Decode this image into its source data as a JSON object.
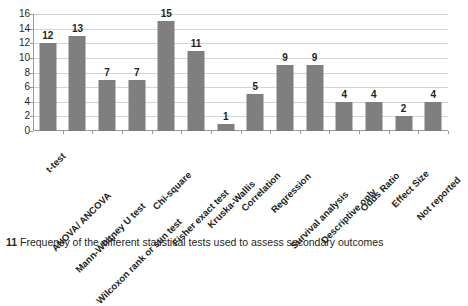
{
  "figure": {
    "caption_number": "11",
    "caption_text": "Frequency of the different statistical tests used to assess secondary outcomes"
  },
  "colors": {
    "bar": "#7f7f7f",
    "gridline": "#d4d4d4",
    "axis": "#9a9a9a",
    "text": "#231f20",
    "background": "#ffffff"
  },
  "chart_data": {
    "type": "bar",
    "title": "",
    "xlabel": "",
    "ylabel": "",
    "ylim": [
      0,
      16
    ],
    "ytick_step": 2,
    "yticks": [
      "0",
      "2",
      "4",
      "6",
      "8",
      "10",
      "12",
      "14",
      "16"
    ],
    "grid": true,
    "legend": false,
    "data_labels": true,
    "categories": [
      "t-test",
      "ANOVA/ ANCOVA",
      "Mann-Whitney U test",
      "Wilcoxon rank or sun test",
      "Chi-square",
      "Fisher exact test",
      "Kruska-Wallis",
      "Correlation",
      "Regression",
      "Survival analysis",
      "Descriptive only",
      "Odds Ratio",
      "Effect Size",
      "Not reported"
    ],
    "values": [
      12,
      13,
      7,
      7,
      15,
      11,
      1,
      5,
      9,
      9,
      4,
      4,
      2,
      4
    ],
    "value_labels": [
      "12",
      "13",
      "7",
      "7",
      "15",
      "11",
      "1",
      "5",
      "9",
      "9",
      "4",
      "4",
      "2",
      "4"
    ]
  }
}
